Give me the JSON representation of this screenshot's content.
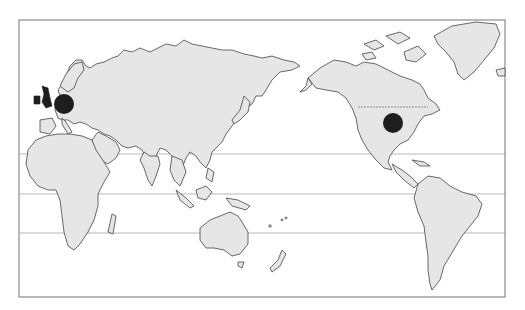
{
  "map": {
    "projection": "Pacific-centered world map",
    "frame": {
      "x": 19,
      "y": 20,
      "width": 486,
      "height": 277
    },
    "colors": {
      "background": "#ffffff",
      "land": "#e6e6e6",
      "outline": "#444444",
      "marker": "#1e1e1e",
      "frame": "#8a8a8a",
      "lat_lines": "#9a9a9a"
    },
    "latitude_lines": [
      {
        "name": "tropic-of-cancer",
        "y": 154
      },
      {
        "name": "equator",
        "y": 194
      },
      {
        "name": "tropic-of-capricorn",
        "y": 233
      }
    ],
    "markers": [
      {
        "name": "europe-marker",
        "region": "Central Europe",
        "cx": 64,
        "cy": 104,
        "r": 10
      },
      {
        "name": "usa-marker",
        "region": "Central United States",
        "cx": 393,
        "cy": 123,
        "r": 10
      }
    ],
    "highlighted_regions": [
      {
        "name": "united-kingdom",
        "shaded": true
      },
      {
        "name": "ireland",
        "shaded": true
      }
    ]
  }
}
